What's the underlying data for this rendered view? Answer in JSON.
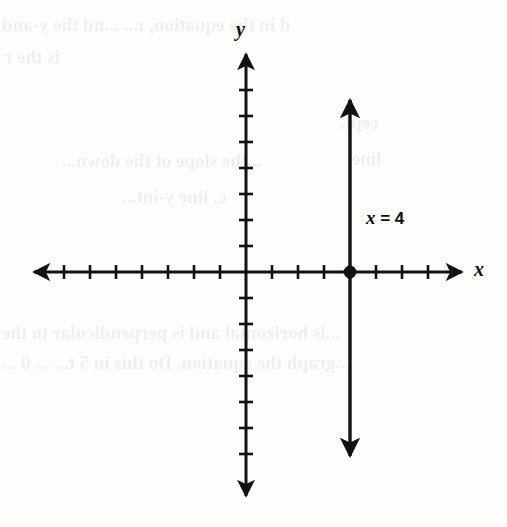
{
  "figure": {
    "background_color": "#fdfdfc",
    "ink_color": "#121212"
  },
  "labels": {
    "y_axis": "y",
    "x_axis": "x",
    "line_equation_var": "x",
    "line_equation_rest": " = 4",
    "line_equation_full": "x = 4"
  },
  "ghost_text": {
    "note": "faint bleed-through text from reverse side of scanned page",
    "lines": [
      {
        "text": "d in the equation, r...  ...nd the y-and",
        "left": 2,
        "top": 14,
        "size": 19
      },
      {
        "text": "is the r",
        "left": 4,
        "top": 46,
        "size": 19
      },
      {
        "text": "cept.",
        "left": 340,
        "top": 112,
        "size": 19
      },
      {
        "text": "...the slope of the down...",
        "left": 62,
        "top": 150,
        "size": 19
      },
      {
        "text": "line",
        "left": 352,
        "top": 148,
        "size": 19
      },
      {
        "text": "c. line y-int...",
        "left": 122,
        "top": 186,
        "size": 19
      },
      {
        "text": "...is horizontal and is perpendicular to the",
        "left": 2,
        "top": 322,
        "size": 19
      },
      {
        "text": "...graph the equation. Do this in 5 t... ... 0 ...",
        "left": 2,
        "top": 352,
        "size": 19
      }
    ]
  },
  "chart_data": {
    "type": "line",
    "title": "x = 4",
    "xlabel": "x",
    "ylabel": "y",
    "grid": false,
    "legend": false,
    "xlim": [
      -8,
      8
    ],
    "ylim": [
      -8,
      8
    ],
    "tick_interval": 1,
    "ticks_negative_x": 7,
    "ticks_positive_x": 7,
    "ticks_positive_y": 7,
    "ticks_negative_y": 7,
    "tick_labels_shown": false,
    "series": [
      {
        "name": "x = 4",
        "equation": "x = 4",
        "orientation": "vertical",
        "x_intercept": 4,
        "slope": "undefined",
        "x": [
          4,
          4
        ],
        "y": [
          -7,
          7
        ],
        "arrow_start": true,
        "arrow_end": true,
        "color": "#121212"
      }
    ],
    "points": [
      {
        "label": "x-intercept",
        "x": 4,
        "y": 0,
        "marker": "filled-circle",
        "color": "#121212"
      }
    ],
    "annotations": [
      {
        "text": "x = 4",
        "x": 4.7,
        "y": 1.9
      }
    ],
    "axes": {
      "x_axis_arrows": "both",
      "y_axis_arrows": "both",
      "origin_labeled": false
    }
  },
  "geometry": {
    "origin_px": {
      "x": 246,
      "y": 272
    },
    "unit_px": 26,
    "x_axis_span_px": {
      "from": 30,
      "to": 466
    },
    "y_axis_span_px": {
      "from": 50,
      "to": 500
    },
    "vertical_line_px": {
      "x": 351,
      "top": 94,
      "bottom": 462
    },
    "point_px": {
      "x": 351,
      "y": 272,
      "r": 6
    },
    "tick_half_len_px": 7,
    "stroke_width_px": 3
  }
}
